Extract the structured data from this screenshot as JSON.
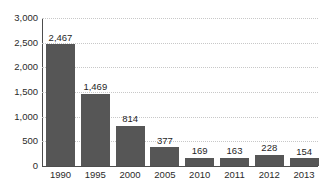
{
  "chart_data": {
    "type": "bar",
    "title": "",
    "subtitle": "",
    "xlabel": "",
    "ylabel": "",
    "categories": [
      "1990",
      "1995",
      "2000",
      "2005",
      "2010",
      "2011",
      "2012",
      "2013"
    ],
    "values": [
      2467,
      1469,
      814,
      377,
      169,
      163,
      228,
      154
    ],
    "data_labels": [
      "2,467",
      "1,469",
      "814",
      "377",
      "169",
      "163",
      "228",
      "154"
    ],
    "series": [
      {
        "name": "",
        "values": [
          2467,
          1469,
          814,
          377,
          169,
          163,
          228,
          154
        ],
        "color": "#565656"
      }
    ],
    "ylim": [
      0,
      3000
    ],
    "ytick_step": 500,
    "ytick_labels": [
      "3,000",
      "2,500",
      "2,000",
      "1,500",
      "1,000",
      "500",
      "0"
    ],
    "ytick_values": [
      3000,
      2500,
      2000,
      1500,
      1000,
      500,
      0
    ],
    "grid": true,
    "grid_style": "dotted",
    "grid_color": "#c8c8c8",
    "legend": false,
    "legend_position": "none",
    "axis_color": "#4d4d4d",
    "bar_color": "#565656",
    "label_color": "#1f1f1f",
    "background": "#ffffff"
  }
}
